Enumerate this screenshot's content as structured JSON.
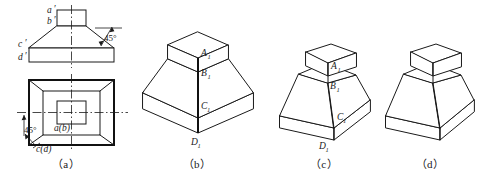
{
  "figure": {
    "background_color": "#ffffff",
    "line_color": "#1a1a1a"
  },
  "panels": [
    {
      "id": "a",
      "caption": "（a）",
      "description": "Two orthographic views: front view on top, top (plan) view below",
      "labels": [
        {
          "name": "a-prime",
          "text": "a",
          "prime": "′"
        },
        {
          "name": "b-prime",
          "text": "b",
          "prime": "′"
        },
        {
          "name": "c-prime",
          "text": "c",
          "prime": "′"
        },
        {
          "name": "d-prime",
          "text": "d",
          "prime": "′"
        },
        {
          "name": "ab-plan",
          "text": "a(b)"
        },
        {
          "name": "cd-plan",
          "text": "c(d)"
        }
      ],
      "angles": [
        {
          "name": "front-view-angle",
          "text": "45°"
        },
        {
          "name": "plan-view-angle",
          "text": "45°"
        }
      ]
    },
    {
      "id": "b",
      "caption": "（b）",
      "description": "Isometric option b: stepped square block with tapered base",
      "labels": [
        {
          "name": "A1",
          "text": "A",
          "sub": "1"
        },
        {
          "name": "B1",
          "text": "B",
          "sub": "1"
        },
        {
          "name": "C1",
          "text": "C",
          "sub": "1"
        },
        {
          "name": "D1",
          "text": "D",
          "sub": "1"
        }
      ]
    },
    {
      "id": "c",
      "caption": "（c）",
      "description": "Isometric option c: small prism on frustum with slab base",
      "labels": [
        {
          "name": "A1",
          "text": "A",
          "sub": "1"
        },
        {
          "name": "B1",
          "text": "B",
          "sub": "1"
        },
        {
          "name": "C1",
          "text": "C",
          "sub": "1"
        },
        {
          "name": "D1",
          "text": "D",
          "sub": "1"
        }
      ]
    },
    {
      "id": "d",
      "caption": "（d）",
      "description": "Isometric option d: same solid as c, unlabelled",
      "labels": []
    }
  ]
}
